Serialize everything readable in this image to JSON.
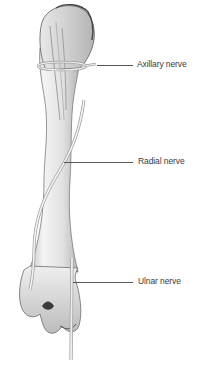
{
  "figure": {
    "labels": [
      {
        "id": "axillary",
        "text": "Axillary nerve"
      },
      {
        "id": "radial",
        "text": "Radial nerve"
      },
      {
        "id": "ulnar",
        "text": "Ulnar nerve"
      }
    ],
    "colors": {
      "bone_light": "#f2f2f2",
      "bone_mid": "#d6d6d6",
      "bone_dark": "#9a9a9a",
      "outline": "#5a5a5a",
      "nerve_fill": "#eeeeee",
      "nerve_outline": "#9c9c9c",
      "leader": "#555555",
      "text": "#3a3a3a"
    }
  }
}
